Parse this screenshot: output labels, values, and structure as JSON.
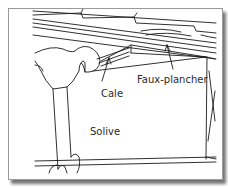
{
  "figure": {
    "labels": {
      "shim": "Cale",
      "subfloor": "Faux-plancher",
      "joist": "Solive"
    },
    "colors": {
      "line": "#1a1a1a",
      "background": "#ffffff",
      "frame_border": "#9a9a9a"
    }
  }
}
